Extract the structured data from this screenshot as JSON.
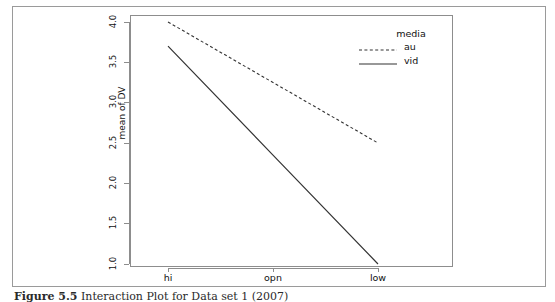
{
  "figure": {
    "background_color": "#ffffff",
    "border_color": "#9a9a9a",
    "caption_label": "Figure 5.5",
    "caption_text": "Interaction Plot for Data set 1 (2007)"
  },
  "chart_data": {
    "type": "line",
    "title": "",
    "xlabel": "",
    "ylabel": "mean of DV",
    "categories": [
      "hi",
      "opn",
      "low"
    ],
    "ylim": [
      1.0,
      4.0
    ],
    "yticks": [
      "1.0",
      "1.5",
      "2.0",
      "2.5",
      "3.0",
      "3.5",
      "4.0"
    ],
    "ytick_values": [
      1.0,
      1.5,
      2.0,
      2.5,
      3.0,
      3.5,
      4.0
    ],
    "grid": false,
    "legend_position": "top-right-inside",
    "legend_title": "media",
    "series": [
      {
        "name": "au",
        "style": "dashed",
        "color": "#333333",
        "values": [
          4.0,
          3.25,
          2.5
        ]
      },
      {
        "name": "vid",
        "style": "solid",
        "color": "#333333",
        "values": [
          3.7,
          2.35,
          1.0
        ]
      }
    ]
  },
  "axes": {
    "y_axis_title": "mean of DV",
    "y_tick_labels": [
      "4.0",
      "3.5",
      "3.0",
      "2.5",
      "2.0",
      "1.5",
      "1.0"
    ],
    "x_tick_labels": [
      "hi",
      "opn",
      "low"
    ]
  },
  "legend": {
    "title": "media",
    "entries": [
      {
        "label": "au",
        "style": "dashed"
      },
      {
        "label": "vid",
        "style": "solid"
      }
    ]
  }
}
